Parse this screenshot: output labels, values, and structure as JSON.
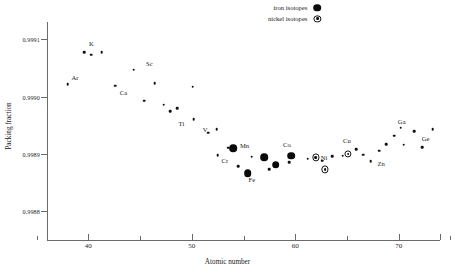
{
  "chart_data": {
    "type": "scatter",
    "title": "",
    "xlabel": "Atomic number",
    "ylabel": "Packing fraction",
    "xlim": [
      36,
      74
    ],
    "ylim": [
      0.99875,
      0.99913
    ],
    "grid": false,
    "xticks": [
      40,
      50,
      60,
      70
    ],
    "xticklabels": [
      "40",
      "50",
      "60",
      "70"
    ],
    "yticks": [
      0.9991,
      0.999,
      0.9989,
      0.9988
    ],
    "yticklabels": [
      "0.9991",
      "0.9990",
      "0.9989",
      "0.9988"
    ],
    "legend": {
      "position": "top-right",
      "entries": [
        {
          "label": "iron isotopes",
          "marker": "filled-circle"
        },
        {
          "label": "nickel isotopes",
          "marker": "dotted-circle"
        }
      ]
    },
    "series": [
      {
        "name": "isotopes",
        "marker": "small-dot",
        "points": [
          {
            "x": 38.0,
            "y": 0.999022
          },
          {
            "x": 39.6,
            "y": 0.999077
          },
          {
            "x": 40.3,
            "y": 0.999073
          },
          {
            "x": 41.3,
            "y": 0.999077
          },
          {
            "x": 42.6,
            "y": 0.999019
          },
          {
            "x": 44.4,
            "y": 0.999047
          },
          {
            "x": 45.4,
            "y": 0.998993
          },
          {
            "x": 46.4,
            "y": 0.999023
          },
          {
            "x": 47.3,
            "y": 0.998986
          },
          {
            "x": 47.9,
            "y": 0.998974
          },
          {
            "x": 48.6,
            "y": 0.99898
          },
          {
            "x": 50.1,
            "y": 0.999017
          },
          {
            "x": 50.2,
            "y": 0.998961
          },
          {
            "x": 51.6,
            "y": 0.998937
          },
          {
            "x": 52.4,
            "y": 0.998943
          },
          {
            "x": 52.5,
            "y": 0.998898
          },
          {
            "x": 53.5,
            "y": 0.998911
          },
          {
            "x": 54.5,
            "y": 0.998879
          },
          {
            "x": 55.8,
            "y": 0.998895
          },
          {
            "x": 57.1,
            "y": 0.998894
          },
          {
            "x": 57.5,
            "y": 0.998873
          },
          {
            "x": 59.4,
            "y": 0.998886
          },
          {
            "x": 61.2,
            "y": 0.998892
          },
          {
            "x": 62.6,
            "y": 0.998888
          },
          {
            "x": 63.6,
            "y": 0.998896
          },
          {
            "x": 64.6,
            "y": 0.998897
          },
          {
            "x": 65.9,
            "y": 0.998908
          },
          {
            "x": 66.6,
            "y": 0.998899
          },
          {
            "x": 67.3,
            "y": 0.998887
          },
          {
            "x": 68.1,
            "y": 0.998906
          },
          {
            "x": 68.8,
            "y": 0.998917
          },
          {
            "x": 69.6,
            "y": 0.998932
          },
          {
            "x": 70.2,
            "y": 0.998946
          },
          {
            "x": 70.5,
            "y": 0.998916
          },
          {
            "x": 71.5,
            "y": 0.99894
          },
          {
            "x": 72.3,
            "y": 0.998912
          },
          {
            "x": 73.3,
            "y": 0.998943
          }
        ]
      },
      {
        "name": "iron isotopes",
        "marker": "filled-circle",
        "points": [
          {
            "x": 54.0,
            "y": 0.99891
          },
          {
            "x": 55.4,
            "y": 0.998866
          },
          {
            "x": 57.0,
            "y": 0.998894
          },
          {
            "x": 58.1,
            "y": 0.998881
          },
          {
            "x": 59.6,
            "y": 0.998897
          }
        ]
      },
      {
        "name": "nickel isotopes",
        "marker": "dotted-circle",
        "points": [
          {
            "x": 62.0,
            "y": 0.998894
          },
          {
            "x": 62.9,
            "y": 0.998873
          },
          {
            "x": 65.1,
            "y": 0.9989
          }
        ]
      }
    ],
    "annotations": [
      {
        "text": "Ar",
        "x": 38.7,
        "y": 0.999034
      },
      {
        "text": "K",
        "x": 40.3,
        "y": 0.999094
      },
      {
        "text": "Ca",
        "x": 43.4,
        "y": 0.999008
      },
      {
        "text": "Sc",
        "x": 45.9,
        "y": 0.999058
      },
      {
        "text": "Ti",
        "x": 49.0,
        "y": 0.998954
      },
      {
        "text": "V",
        "x": 51.3,
        "y": 0.998943
      },
      {
        "text": "Cr",
        "x": 53.2,
        "y": 0.99889
      },
      {
        "text": "Mn",
        "x": 55.1,
        "y": 0.998916
      },
      {
        "text": "Fe",
        "x": 55.8,
        "y": 0.998857
      },
      {
        "text": "Co",
        "x": 59.2,
        "y": 0.998918
      },
      {
        "text": "Ni",
        "x": 62.8,
        "y": 0.998895
      },
      {
        "text": "Cu",
        "x": 65.0,
        "y": 0.998924
      },
      {
        "text": "Zn",
        "x": 68.3,
        "y": 0.998885
      },
      {
        "text": "Ga",
        "x": 70.3,
        "y": 0.998958
      },
      {
        "text": "Ge",
        "x": 72.6,
        "y": 0.998927
      }
    ]
  }
}
